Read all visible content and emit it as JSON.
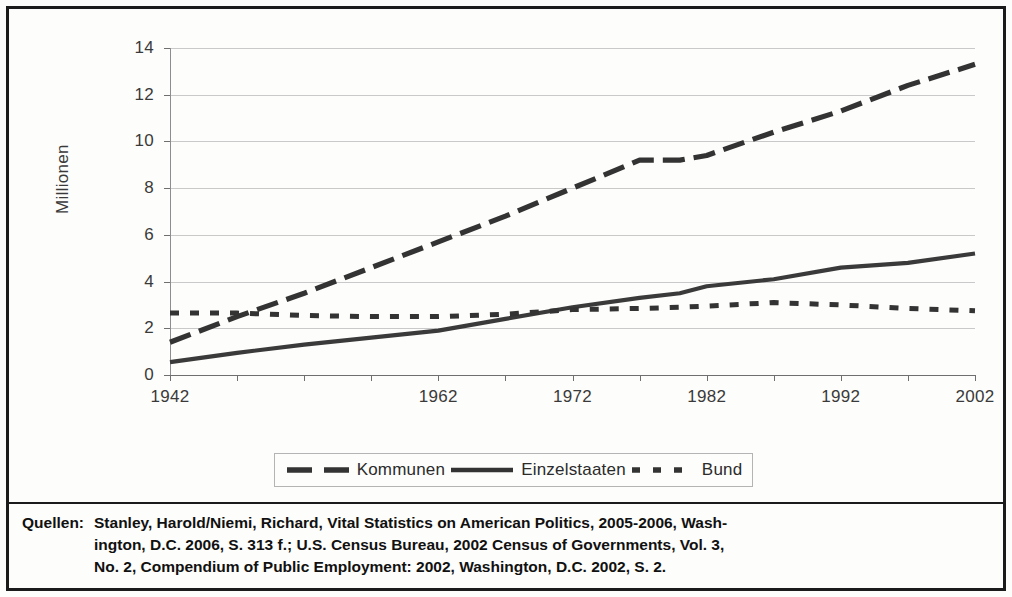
{
  "chart_data": {
    "type": "line",
    "title": "",
    "xlabel": "",
    "ylabel": "Millionen",
    "xlim": [
      1942,
      2002
    ],
    "ylim": [
      0,
      14
    ],
    "ytick_labels": [
      "14",
      "12",
      "10",
      "8",
      "6",
      "4",
      "2",
      "0"
    ],
    "ytick_values": [
      14,
      12,
      10,
      8,
      6,
      4,
      2,
      0
    ],
    "xtick_labels": [
      "1942",
      "1962",
      "1972",
      "1982",
      "1992",
      "2002"
    ],
    "xtick_values": [
      1942,
      1962,
      1972,
      1982,
      1992,
      2002
    ],
    "minor_xticks": [
      1947,
      1952,
      1957,
      1967,
      1977,
      1987,
      1997
    ],
    "grid": true,
    "legend_position": "bottom",
    "x": [
      1942,
      1947,
      1952,
      1957,
      1962,
      1967,
      1972,
      1977,
      1980,
      1982,
      1987,
      1992,
      1997,
      2002
    ],
    "series": [
      {
        "name": "Kommunen",
        "style": "long-dashed",
        "color": "#333333",
        "values": [
          1.4,
          2.5,
          3.5,
          4.6,
          5.7,
          6.8,
          8.0,
          9.2,
          9.2,
          9.4,
          10.4,
          11.3,
          12.4,
          13.3
        ]
      },
      {
        "name": "Einzelstaaten",
        "style": "solid",
        "color": "#3a3a3a",
        "values": [
          0.55,
          0.95,
          1.3,
          1.6,
          1.9,
          2.4,
          2.9,
          3.3,
          3.5,
          3.8,
          4.1,
          4.6,
          4.8,
          5.2
        ]
      },
      {
        "name": "Bund",
        "style": "short-dashed",
        "color": "#333333",
        "values": [
          2.65,
          2.65,
          2.55,
          2.5,
          2.5,
          2.6,
          2.8,
          2.85,
          2.9,
          2.95,
          3.1,
          3.0,
          2.85,
          2.75
        ]
      }
    ]
  },
  "legend": {
    "items": [
      {
        "label": "Kommunen",
        "style": "long-dashed"
      },
      {
        "label": "Einzelstaaten",
        "style": "solid"
      },
      {
        "label": "Bund",
        "style": "short-dashed"
      }
    ]
  },
  "source": {
    "label": "Quellen:",
    "line1": "Stanley, Harold/Niemi, Richard, Vital Statistics on American Politics, 2005-2006, Wash-",
    "line2": "ington, D.C. 2006, S. 313 f.; U.S. Census Bureau, 2002 Census of Governments, Vol. 3,",
    "line3": "No. 2, Compendium of Public Employment: 2002, Washington, D.C. 2002, S. 2."
  }
}
